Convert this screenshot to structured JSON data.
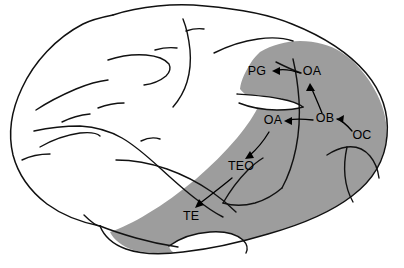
{
  "figure": {
    "title": "Lateral view of macaque brain showing visual cortical processing pathways",
    "background_color": "#ffffff",
    "shaded_region_color": "#9d9d9d",
    "outline_color": "#111111",
    "label_color": "#000000"
  },
  "labels": [
    {
      "id": "pg",
      "text": "PG",
      "x": 257,
      "y": 75,
      "anchor": "middle"
    },
    {
      "id": "oa_dorsal",
      "text": "OA",
      "x": 312,
      "y": 75,
      "anchor": "middle"
    },
    {
      "id": "oa_ventral",
      "text": "OA",
      "x": 273,
      "y": 124,
      "anchor": "middle"
    },
    {
      "id": "ob",
      "text": "OB",
      "x": 325,
      "y": 122,
      "anchor": "middle"
    },
    {
      "id": "oc",
      "text": "OC",
      "x": 362,
      "y": 139,
      "anchor": "middle"
    },
    {
      "id": "teo",
      "text": "TEO",
      "x": 241,
      "y": 170,
      "anchor": "middle"
    },
    {
      "id": "te",
      "text": "TE",
      "x": 191,
      "y": 220,
      "anchor": "middle"
    }
  ],
  "pathways": [
    {
      "id": "oc-to-ob",
      "from": "OC",
      "to": "OB",
      "description": "arrow from OC to OB"
    },
    {
      "id": "ob-to-oa-d",
      "from": "OB",
      "to": "OA",
      "description": "arrow from OB up to dorsal OA"
    },
    {
      "id": "ob-to-oa-v",
      "from": "OB",
      "to": "OA",
      "description": "arrow from OB left to ventral OA"
    },
    {
      "id": "oa-to-pg",
      "from": "OA",
      "to": "PG",
      "description": "arrow from dorsal OA to PG"
    },
    {
      "id": "oa-to-teo",
      "from": "OA",
      "to": "TEO",
      "description": "arrow from ventral OA to TEO"
    },
    {
      "id": "teo-to-te",
      "from": "TEO",
      "to": "TE",
      "description": "arrow from TEO to TE"
    }
  ]
}
